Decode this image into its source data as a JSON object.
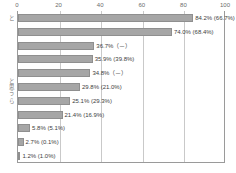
{
  "chart_data": {
    "type": "bar",
    "orientation": "horizontal",
    "title": "",
    "subtitle": "",
    "xlabel": "",
    "ylabel": "",
    "xlim": [
      0,
      100
    ],
    "xticks": [
      0,
      20,
      40,
      60,
      80,
      100
    ],
    "xtick_labels": [
      "0",
      "20",
      "40",
      "60",
      "80",
      "100"
    ],
    "grid": true,
    "grid_axis": "x",
    "legend": "none",
    "bar_color": "#a6a6a6",
    "bar_edge_color": "#8f8f8f",
    "axis_color": "#9a9a9a",
    "grid_color": "#c9c9c9",
    "categories": [
      "と",
      "",
      "",
      "",
      "",
      "と\n思\nう",
      "ら",
      "",
      "",
      "",
      ""
    ],
    "values": [
      84.2,
      74.0,
      36.7,
      35.9,
      34.8,
      29.8,
      25.1,
      21.4,
      5.8,
      2.7,
      1.2
    ],
    "comparison_values": [
      66.7,
      68.4,
      null,
      39.8,
      null,
      21.0,
      29.3,
      16.9,
      5.1,
      0.1,
      1.0
    ],
    "data_labels": [
      "84.2% (66.7%)",
      "74.0% (68.4%)",
      "36.7%（－）",
      "35.9% (39.8%)",
      "34.8%（－）",
      "29.8% (21.0%)",
      "25.1% (29.3%)",
      "21.4% (16.9%)",
      "5.8% (5.1%)",
      "2.7% (0.1%)",
      "1.2% (1.0%)"
    ],
    "series": [
      {
        "name": "current",
        "values": [
          84.2,
          74.0,
          36.7,
          35.9,
          34.8,
          29.8,
          25.1,
          21.4,
          5.8,
          2.7,
          1.2
        ]
      },
      {
        "name": "previous",
        "values": [
          66.7,
          68.4,
          null,
          39.8,
          null,
          21.0,
          29.3,
          16.9,
          5.1,
          0.1,
          1.0
        ]
      }
    ]
  }
}
